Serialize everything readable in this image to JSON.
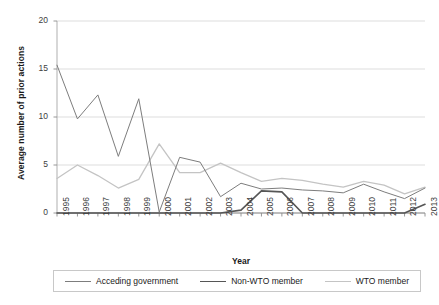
{
  "chart_data": {
    "type": "line",
    "title": "",
    "xlabel": "Year",
    "ylabel": "Average number of prior actions",
    "categories": [
      "1995",
      "1996",
      "1997",
      "1998",
      "1999",
      "2000",
      "2001",
      "2002",
      "2003",
      "2004",
      "2005",
      "2006",
      "2007",
      "2008",
      "2009",
      "2010",
      "2011",
      "2012",
      "2013"
    ],
    "ylim": [
      0,
      20
    ],
    "yticks": [
      0,
      5,
      10,
      15,
      20
    ],
    "grid": "horizontal",
    "legend_position": "bottom",
    "series": [
      {
        "name": "Acceding government",
        "color": "#7d7d7d",
        "values": [
          15.4,
          9.8,
          12.3,
          5.9,
          11.9,
          0.1,
          5.8,
          5.3,
          1.7,
          3.1,
          2.5,
          2.6,
          2.4,
          2.3,
          2.1,
          3.0,
          2.2,
          1.5,
          2.6
        ]
      },
      {
        "name": "Non-WTO member",
        "color": "#565656",
        "values": [
          0.0,
          0.0,
          0.0,
          0.0,
          0.0,
          0.0,
          0.0,
          0.0,
          0.0,
          0.3,
          2.3,
          2.2,
          0.0,
          0.0,
          0.0,
          0.0,
          0.0,
          0.0,
          0.9
        ]
      },
      {
        "name": "WTO member",
        "color": "#c4c4c4",
        "values": [
          3.6,
          5.0,
          3.9,
          2.6,
          3.5,
          7.2,
          4.2,
          4.2,
          5.2,
          4.2,
          3.3,
          3.6,
          3.4,
          3.0,
          2.7,
          3.3,
          2.9,
          2.0,
          2.7
        ]
      }
    ]
  },
  "axes": {
    "ytick_labels": [
      "0",
      "5",
      "10",
      "15",
      "20"
    ]
  },
  "legend": {
    "items": [
      {
        "label": "Acceding government",
        "color": "#7d7d7d",
        "width": "1px"
      },
      {
        "label": "Non-WTO member",
        "color": "#565656",
        "width": "1.6px"
      },
      {
        "label": "WTO member",
        "color": "#c4c4c4",
        "width": "1.3px"
      }
    ]
  }
}
